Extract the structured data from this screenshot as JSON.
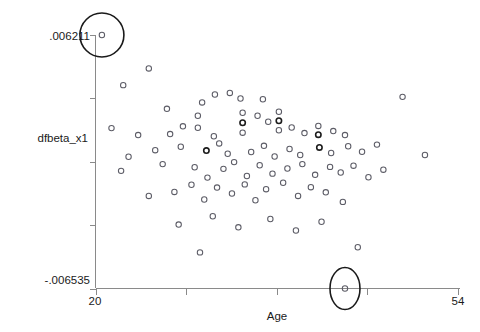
{
  "chart_data": {
    "type": "scatter",
    "title": "",
    "xlabel": "Age",
    "ylabel": "dfbeta_x1",
    "xlim": [
      20,
      54
    ],
    "ylim": [
      -0.006535,
      0.006211
    ],
    "grid": false,
    "legend": null,
    "x_ticks": [
      20,
      28.5,
      37,
      45.5,
      54
    ],
    "x_tick_labels": [
      "20",
      "",
      "",
      "",
      "54"
    ],
    "y_ticks": [
      -0.006535,
      -0.003349,
      -0.000162,
      0.003024,
      0.006211
    ],
    "y_tick_labels": [
      "-.006535",
      "",
      "",
      "",
      ".006211"
    ],
    "marker": "open-circle",
    "annotations": [
      {
        "name": "high-leverage-outlier-circle",
        "shape": "ellipse",
        "x": 20.6,
        "y": 0.006211,
        "rx_px": 22,
        "ry_px": 22,
        "note": "circled outlier at top-left"
      },
      {
        "name": "low-outlier-circle",
        "shape": "ellipse",
        "x": 43.4,
        "y": -0.006535,
        "rx_px": 15,
        "ry_px": 21,
        "note": "circled outlier on the x-axis baseline"
      }
    ],
    "points": [
      {
        "x": 20.6,
        "y": 0.006211
      },
      {
        "x": 25.0,
        "y": 0.00453
      },
      {
        "x": 22.6,
        "y": 0.00369
      },
      {
        "x": 26.7,
        "y": 0.0025
      },
      {
        "x": 30.0,
        "y": 0.00282
      },
      {
        "x": 31.2,
        "y": 0.00322
      },
      {
        "x": 32.6,
        "y": 0.0033
      },
      {
        "x": 33.6,
        "y": 0.00302
      },
      {
        "x": 35.7,
        "y": 0.00298
      },
      {
        "x": 21.5,
        "y": 0.00153
      },
      {
        "x": 24.0,
        "y": 0.00118
      },
      {
        "x": 28.2,
        "y": 0.00162
      },
      {
        "x": 27.0,
        "y": 0.00123
      },
      {
        "x": 29.6,
        "y": 0.00215
      },
      {
        "x": 29.6,
        "y": 0.00155
      },
      {
        "x": 31.1,
        "y": 0.00112
      },
      {
        "x": 33.8,
        "y": 0.0023
      },
      {
        "x": 33.8,
        "y": 0.0018
      },
      {
        "x": 33.8,
        "y": 0.0013
      },
      {
        "x": 35.2,
        "y": 0.00215
      },
      {
        "x": 36.2,
        "y": 0.00185
      },
      {
        "x": 37.2,
        "y": 0.00235
      },
      {
        "x": 37.2,
        "y": 0.0019
      },
      {
        "x": 37.2,
        "y": 0.00142
      },
      {
        "x": 38.4,
        "y": 0.00156
      },
      {
        "x": 39.6,
        "y": 0.00128
      },
      {
        "x": 40.9,
        "y": 0.00164
      },
      {
        "x": 40.9,
        "y": 0.0012
      },
      {
        "x": 42.3,
        "y": 0.00138
      },
      {
        "x": 43.4,
        "y": 0.00118
      },
      {
        "x": 23.1,
        "y": 9e-05
      },
      {
        "x": 25.6,
        "y": 0.00042
      },
      {
        "x": 28.0,
        "y": 0.00059
      },
      {
        "x": 30.4,
        "y": 0.0004
      },
      {
        "x": 31.6,
        "y": 0.00076
      },
      {
        "x": 32.4,
        "y": 0.00024
      },
      {
        "x": 34.6,
        "y": 0.00033
      },
      {
        "x": 35.8,
        "y": 0.00064
      },
      {
        "x": 36.8,
        "y": 0.0001
      },
      {
        "x": 38.2,
        "y": 0.00048
      },
      {
        "x": 39.2,
        "y": 0.00018
      },
      {
        "x": 41.0,
        "y": 0.00056
      },
      {
        "x": 42.1,
        "y": 0.00028
      },
      {
        "x": 43.7,
        "y": 0.00062
      },
      {
        "x": 45.0,
        "y": 0.00034
      },
      {
        "x": 46.4,
        "y": 0.0007
      },
      {
        "x": 48.8,
        "y": 0.0031
      },
      {
        "x": 50.9,
        "y": 0.00018
      },
      {
        "x": 22.4,
        "y": -0.00062
      },
      {
        "x": 26.3,
        "y": -0.00028
      },
      {
        "x": 29.3,
        "y": -0.00044
      },
      {
        "x": 30.5,
        "y": -0.00096
      },
      {
        "x": 32.0,
        "y": -0.00052
      },
      {
        "x": 33.0,
        "y": -0.00018
      },
      {
        "x": 34.2,
        "y": -0.00088
      },
      {
        "x": 35.4,
        "y": -0.00034
      },
      {
        "x": 36.6,
        "y": -0.00076
      },
      {
        "x": 38.0,
        "y": -0.0005
      },
      {
        "x": 39.4,
        "y": -0.00028
      },
      {
        "x": 40.6,
        "y": -0.00082
      },
      {
        "x": 42.0,
        "y": -0.00042
      },
      {
        "x": 43.0,
        "y": -0.0007
      },
      {
        "x": 44.2,
        "y": -0.00036
      },
      {
        "x": 45.6,
        "y": -0.00094
      },
      {
        "x": 47.0,
        "y": -0.00056
      },
      {
        "x": 25.0,
        "y": -0.00188
      },
      {
        "x": 27.4,
        "y": -0.00168
      },
      {
        "x": 29.0,
        "y": -0.00132
      },
      {
        "x": 30.2,
        "y": -0.00206
      },
      {
        "x": 31.4,
        "y": -0.00146
      },
      {
        "x": 32.8,
        "y": -0.00176
      },
      {
        "x": 34.0,
        "y": -0.0013
      },
      {
        "x": 35.0,
        "y": -0.0021
      },
      {
        "x": 36.0,
        "y": -0.00154
      },
      {
        "x": 37.6,
        "y": -0.00122
      },
      {
        "x": 39.0,
        "y": -0.00188
      },
      {
        "x": 40.2,
        "y": -0.00144
      },
      {
        "x": 41.6,
        "y": -0.0017
      },
      {
        "x": 43.2,
        "y": -0.00218
      },
      {
        "x": 27.8,
        "y": -0.00332
      },
      {
        "x": 31.0,
        "y": -0.0029
      },
      {
        "x": 33.4,
        "y": -0.00346
      },
      {
        "x": 36.4,
        "y": -0.00304
      },
      {
        "x": 38.8,
        "y": -0.00362
      },
      {
        "x": 41.2,
        "y": -0.00318
      },
      {
        "x": 44.6,
        "y": -0.00446
      },
      {
        "x": 29.8,
        "y": -0.00472
      },
      {
        "x": 43.4,
        "y": -0.006535
      }
    ]
  }
}
